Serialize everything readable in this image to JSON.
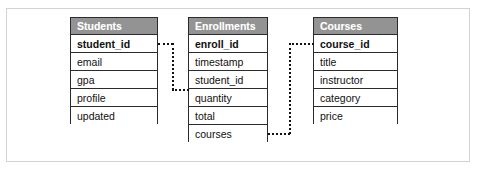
{
  "diagram": {
    "type": "er-diagram",
    "header_color": "#939393",
    "border_color": "#2b2b2b",
    "frame_color": "#d2d2d2",
    "connector_style": "dotted",
    "connector_color": "#111111"
  },
  "tables": [
    {
      "name": "Students",
      "fields": [
        {
          "name": "student_id",
          "primary_key": true
        },
        {
          "name": "email",
          "primary_key": false
        },
        {
          "name": "gpa",
          "primary_key": false
        },
        {
          "name": "profile",
          "primary_key": false
        },
        {
          "name": "updated",
          "primary_key": false
        }
      ]
    },
    {
      "name": "Enrollments",
      "fields": [
        {
          "name": "enroll_id",
          "primary_key": true
        },
        {
          "name": "timestamp",
          "primary_key": false
        },
        {
          "name": "student_id",
          "primary_key": false
        },
        {
          "name": "quantity",
          "primary_key": false
        },
        {
          "name": "total",
          "primary_key": false
        },
        {
          "name": "courses",
          "primary_key": false
        }
      ]
    },
    {
      "name": "Courses",
      "fields": [
        {
          "name": "course_id",
          "primary_key": true
        },
        {
          "name": "title",
          "primary_key": false
        },
        {
          "name": "instructor",
          "primary_key": false
        },
        {
          "name": "category",
          "primary_key": false
        },
        {
          "name": "price",
          "primary_key": false
        }
      ]
    }
  ],
  "relationships": [
    {
      "from_table": "Students",
      "from_field": "student_id",
      "to_table": "Enrollments",
      "to_field": "student_id"
    },
    {
      "from_table": "Enrollments",
      "from_field": "courses",
      "to_table": "Courses",
      "to_field": "course_id"
    }
  ]
}
